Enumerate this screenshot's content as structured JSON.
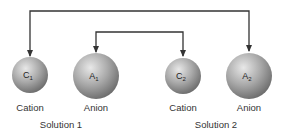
{
  "diagram": {
    "ions": [
      {
        "symbol": "C",
        "sub": "1",
        "type": "Cation",
        "cx": 30,
        "cy": 75,
        "r": 18
      },
      {
        "symbol": "A",
        "sub": "1",
        "type": "Anion",
        "cx": 96,
        "cy": 76,
        "r": 23
      },
      {
        "symbol": "C",
        "sub": "2",
        "type": "Cation",
        "cx": 183,
        "cy": 76,
        "r": 18
      },
      {
        "symbol": "A",
        "sub": "2",
        "type": "Anion",
        "cx": 249,
        "cy": 76,
        "r": 23
      }
    ],
    "solutions": [
      {
        "label": "Solution 1"
      },
      {
        "label": "Solution 2"
      }
    ],
    "connections": [
      {
        "from": "C1",
        "to": "A2",
        "description": "outer exchange line"
      },
      {
        "from": "A1",
        "to": "C2",
        "description": "inner exchange line"
      }
    ],
    "colors": {
      "line": "#333333",
      "sphere_light": "#e6e6e6",
      "sphere_dark": "#7a7a7a",
      "text": "#333333"
    }
  }
}
